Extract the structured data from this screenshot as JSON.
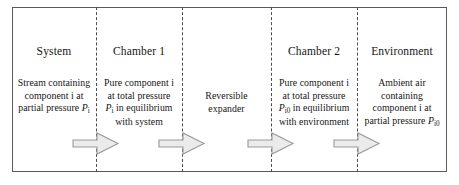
{
  "figure": {
    "frame_color": "#5a5a5a",
    "divider_color": "#4c4c4c",
    "arrow_fill": "#ebebeb",
    "arrow_stroke": "#9a9a9a",
    "text_color": "#151515"
  },
  "columns": [
    {
      "key": "system",
      "title": "System",
      "lines": [
        {
          "prefix": "Stream containing",
          "var": "",
          "sub": "",
          "suffix": ""
        },
        {
          "prefix": "component i at",
          "var": "",
          "sub": "",
          "suffix": ""
        },
        {
          "prefix": "partial pressure ",
          "var": "P",
          "sub": "i",
          "suffix": ""
        }
      ]
    },
    {
      "key": "chamber-1",
      "title": "Chamber 1",
      "lines": [
        {
          "prefix": "Pure component i",
          "var": "",
          "sub": "",
          "suffix": ""
        },
        {
          "prefix": "at total pressure",
          "var": "",
          "sub": "",
          "suffix": ""
        },
        {
          "prefix": "",
          "var": "P",
          "sub": "i",
          "suffix": " in equilibrium"
        },
        {
          "prefix": "with system",
          "var": "",
          "sub": "",
          "suffix": ""
        }
      ]
    },
    {
      "key": "expander",
      "title": "",
      "lines": [
        {
          "prefix": "Reversible",
          "var": "",
          "sub": "",
          "suffix": ""
        },
        {
          "prefix": "expander",
          "var": "",
          "sub": "",
          "suffix": ""
        }
      ]
    },
    {
      "key": "chamber-2",
      "title": "Chamber 2",
      "lines": [
        {
          "prefix": "Pure component i",
          "var": "",
          "sub": "",
          "suffix": ""
        },
        {
          "prefix": "at total pressure",
          "var": "",
          "sub": "",
          "suffix": ""
        },
        {
          "prefix": "",
          "var": "P",
          "sub": "i0",
          "suffix": " in equilibrium"
        },
        {
          "prefix": "with environment",
          "var": "",
          "sub": "",
          "suffix": ""
        }
      ]
    },
    {
      "key": "environment",
      "title": "Environment",
      "lines": [
        {
          "prefix": "Ambient air",
          "var": "",
          "sub": "",
          "suffix": ""
        },
        {
          "prefix": "containing",
          "var": "",
          "sub": "",
          "suffix": ""
        },
        {
          "prefix": "component i at",
          "var": "",
          "sub": "",
          "suffix": ""
        },
        {
          "prefix": "partial pressure ",
          "var": "P",
          "sub": "i0",
          "suffix": ""
        }
      ]
    }
  ],
  "arrows": [
    {
      "key": "flow-arrow-1",
      "direction": "right"
    },
    {
      "key": "flow-arrow-2",
      "direction": "right"
    },
    {
      "key": "flow-arrow-3",
      "direction": "right"
    },
    {
      "key": "flow-arrow-4",
      "direction": "right"
    }
  ]
}
